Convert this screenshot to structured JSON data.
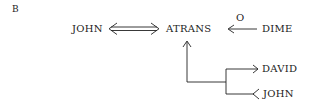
{
  "panel_label": "B",
  "nodes": {
    "actor": "JOHN",
    "act": "ATRANS",
    "object": "DIME",
    "recipient_to": "DAVID",
    "recipient_from": "JOHN"
  },
  "links": {
    "actor_act": "two-way double arrow",
    "object_label": "O",
    "recipient": "R branch (to / from)"
  },
  "colors": {
    "ink": "#222222",
    "background": "#ffffff"
  }
}
